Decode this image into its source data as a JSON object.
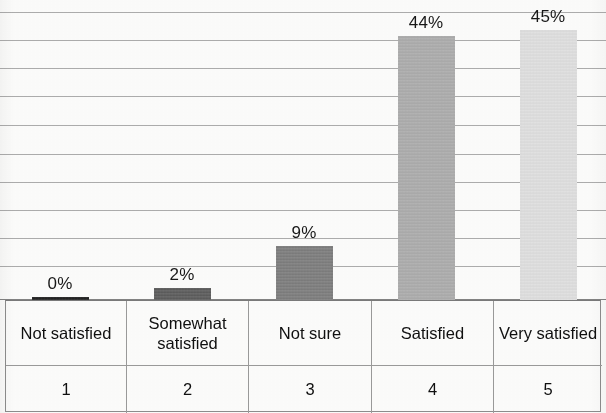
{
  "chart_data": {
    "type": "bar",
    "title": "",
    "subtitle": "",
    "xlabel": "",
    "ylabel": "",
    "ylim": [
      0,
      48
    ],
    "grid": true,
    "gridline_count": 11,
    "legend": "none",
    "categories": [
      "Not satisfied",
      "Somewhat satisfied",
      "Not sure",
      "Satisfied",
      "Very satisfied"
    ],
    "scale_numbers": [
      "1",
      "2",
      "3",
      "4",
      "5"
    ],
    "values": [
      0,
      2,
      9,
      44,
      45
    ],
    "value_labels": [
      "0%",
      "2%",
      "9%",
      "44%",
      "45%"
    ],
    "bar_colors": [
      "#1c1c1c",
      "#585858",
      "#7a7a7a",
      "#ababab",
      "#e0e0e0"
    ]
  },
  "chart": {
    "bars": [
      {
        "category": "Not satisfied",
        "scale": "1",
        "value": 0,
        "label": "0%",
        "color": "#1c1c1c"
      },
      {
        "category": "Somewhat satisfied",
        "scale": "2",
        "value": 2,
        "label": "2%",
        "color": "#585858"
      },
      {
        "category": "Not sure",
        "scale": "3",
        "value": 9,
        "label": "9%",
        "color": "#7a7a7a"
      },
      {
        "category": "Satisfied",
        "scale": "4",
        "value": 44,
        "label": "44%",
        "color": "#ababab"
      },
      {
        "category": "Very satisfied",
        "scale": "5",
        "value": 45,
        "label": "45%",
        "color": "#e0e0e0"
      }
    ]
  }
}
